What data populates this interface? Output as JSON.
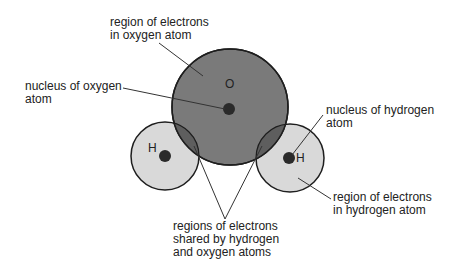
{
  "diagram": {
    "type": "water-molecule-electron-regions",
    "labels": {
      "oxygen_region": "region of electrons\nin oxygen atom",
      "oxygen_nucleus": "nucleus of oxygen\natom",
      "hydrogen_nucleus": "nucleus of hydrogen\natom",
      "hydrogen_region": "region of electrons\nin hydrogen atom",
      "shared_region": "regions of electrons\nshared by hydrogen\nand oxygen atoms"
    },
    "atom_symbols": {
      "oxygen": "O",
      "hydrogen_left": "H",
      "hydrogen_right": "H"
    },
    "colors": {
      "oxygen_fill": "#7a7a7a",
      "hydrogen_fill": "#d9d9d9",
      "overlap_fill": "#5e5e5e",
      "nucleus_fill": "#2a2a2a",
      "outline": "#1e1e1e",
      "leader_line": "#333333"
    }
  }
}
